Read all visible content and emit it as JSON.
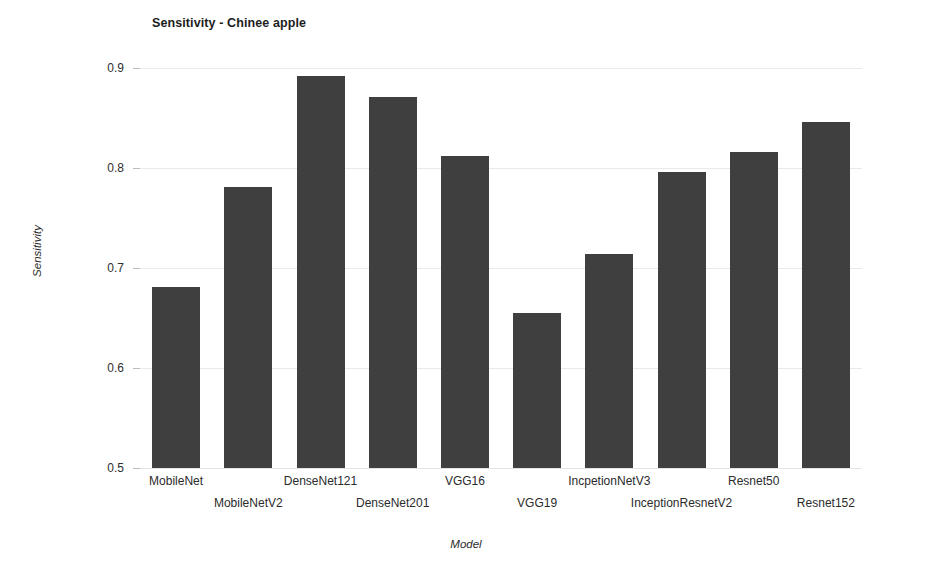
{
  "chart_data": {
    "type": "bar",
    "title": "Sensitivity - Chinee apple",
    "xlabel": "Model",
    "ylabel": "Sensitivity",
    "categories": [
      "MobileNet",
      "MobileNetV2",
      "DenseNet121",
      "DenseNet201",
      "VGG16",
      "VGG19",
      "IncpetionNetV3",
      "InceptionResnetV2",
      "Resnet50",
      "Resnet152"
    ],
    "values": [
      0.681,
      0.781,
      0.892,
      0.871,
      0.812,
      0.655,
      0.714,
      0.796,
      0.816,
      0.846
    ],
    "ylim": [
      0.5,
      0.9
    ],
    "ytick_labels": [
      "0.9",
      "0.8",
      "0.7",
      "0.6",
      "0.5"
    ],
    "ytick_values": [
      0.9,
      0.8,
      0.7,
      0.6,
      0.5
    ],
    "grid": true,
    "legend": false,
    "bar_color": "#3f3f3f",
    "grid_color": "#e9e9e9",
    "background_color": "#ffffff"
  }
}
